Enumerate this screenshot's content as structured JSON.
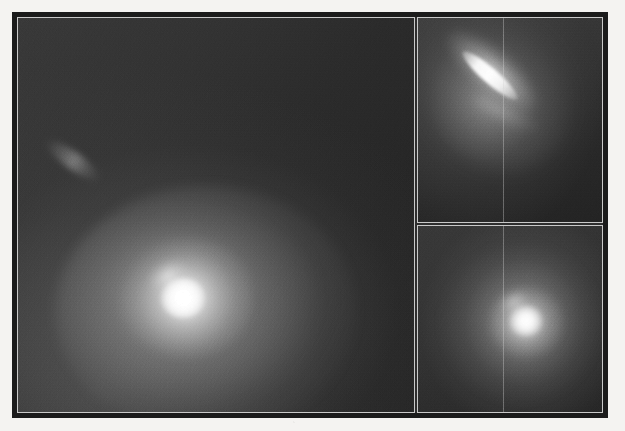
{
  "figure": {
    "domain": "astronomical-imaging",
    "colormap": "grayscale",
    "background_color": "#f4f3f1",
    "frame_color": "#1b1b1b",
    "panel_border_color": "#c9c9c9",
    "panel_count": 3
  },
  "panels": [
    {
      "id": "main",
      "name": "main-field-panel",
      "position": "left",
      "label": "",
      "sources": [
        {
          "name": "bright-nucleus",
          "kind": "point-source-with-coma",
          "center_x_pct": 41,
          "center_y_pct": 70,
          "peak_brightness": 255,
          "note": "saturated white core with broad diffuse halo extending to the south-east"
        },
        {
          "name": "faint-companion-streak",
          "kind": "elongated-diffuse",
          "center_x_pct": 13,
          "center_y_pct": 36,
          "peak_brightness": 150,
          "position_angle_deg": 36,
          "note": "faint elongated smudge in the upper-left quadrant"
        }
      ],
      "background_level": 45,
      "gradient": "brighter toward lower-left, darkest toward upper-right"
    },
    {
      "id": "top-inset",
      "name": "top-zoom-panel",
      "position": "upper-right",
      "label": "",
      "sources": [
        {
          "name": "elongated-jet",
          "kind": "linear-jet",
          "center_x_pct": 38,
          "center_y_pct": 28,
          "peak_brightness": 255,
          "position_angle_deg": 41,
          "note": "bright narrow needle-like feature running north-west to south-east with diffuse envelope"
        }
      ],
      "background_level": 42,
      "seam_line_x_pct": 46
    },
    {
      "id": "bottom-inset",
      "name": "bottom-zoom-panel",
      "position": "lower-right",
      "label": "",
      "sources": [
        {
          "name": "compact-nucleus",
          "kind": "point-source-with-coma",
          "center_x_pct": 58,
          "center_y_pct": 50,
          "peak_brightness": 255,
          "note": "compact saturated core with a smoothly falling circular halo"
        }
      ],
      "background_level": 46,
      "seam_line_x_pct": 46
    }
  ],
  "annotations": {
    "title": "",
    "caption": "",
    "axis_labels": [],
    "tick_labels": [],
    "legend_entries": [],
    "scale_bar": "",
    "compass": ""
  }
}
